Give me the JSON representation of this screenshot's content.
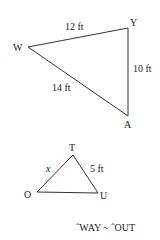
{
  "colors": {
    "line": "#333333",
    "text": "#222222",
    "background": "#ffffff"
  },
  "triangle1": {
    "vertices": {
      "W": {
        "label": "W",
        "x": 28,
        "y": 47
      },
      "Y": {
        "label": "Y",
        "x": 128,
        "y": 28
      },
      "A": {
        "label": "A",
        "x": 128,
        "y": 116
      }
    },
    "sides": {
      "WY": "12 ft",
      "YA": "10 ft",
      "WA": "14 ft"
    }
  },
  "triangle2": {
    "vertices": {
      "T": {
        "label": "T",
        "x": 73,
        "y": 155
      },
      "O": {
        "label": "O",
        "x": 37,
        "y": 192
      },
      "U": {
        "label": "U",
        "x": 98,
        "y": 193
      }
    },
    "sides": {
      "OT": "x",
      "TU": "5 ft"
    }
  },
  "similarity_statement": "ˆWAY ~ ˆOUT"
}
